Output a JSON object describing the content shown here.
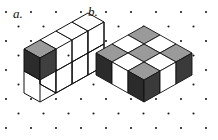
{
  "figure": {
    "background_color": "#ffffff",
    "width": 218,
    "height": 140,
    "grid": {
      "type": "isometric-dot-lattice",
      "dot_color": "#1a1a1a",
      "dot_radius": 1.05,
      "x_spacing": 25,
      "y_spacing": 14.5,
      "row_offset": 12.5,
      "origin_x": 6,
      "origin_y": 12,
      "columns": 10,
      "rows": 10
    },
    "palette": {
      "outline": "#111111",
      "face_top_light": "#ffffff",
      "face_top_shaded": "#9a9a9a",
      "face_left_light": "#ffffff",
      "face_left_dark": "#2b2b2b",
      "face_right_light": "#ffffff",
      "face_right_mid": "#6e6e6e",
      "face_right_dark": "#3a3a3a"
    },
    "panels": [
      {
        "id": "a",
        "label": "a.",
        "description": "Wireframe slab three cubes wide and two cubes tall, one unit deep, with a single solid shaded cube occupying the upper-left cell.",
        "dimensions": {
          "width_cubes": 3,
          "height_cubes": 2,
          "depth_cubes": 1
        },
        "solid_cubes": 1,
        "solid_cube_position": {
          "column": 1,
          "row": "top"
        }
      },
      {
        "id": "b",
        "label": "b.",
        "description": "Solid slab three cubes by three cubes by one cube tall, top face painted in a checkerboard of light and shaded squares.",
        "dimensions": {
          "width_cubes": 3,
          "depth_cubes": 3,
          "height_cubes": 1
        },
        "top_face_checkerboard": [
          [
            "shaded",
            "light",
            "shaded"
          ],
          [
            "light",
            "shaded",
            "light"
          ],
          [
            "shaded",
            "light",
            "shaded"
          ]
        ],
        "left_face_pattern": [
          "dark",
          "light",
          "dark"
        ],
        "right_face_pattern": [
          "dark",
          "light",
          "dark"
        ]
      }
    ]
  }
}
